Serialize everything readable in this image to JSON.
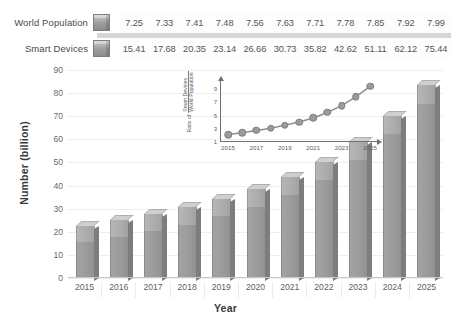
{
  "legend": {
    "rows": [
      {
        "name": "World Population",
        "swatch": "bar-swatch-icon",
        "values": [
          "7.25",
          "7.33",
          "7.41",
          "7.48",
          "7.56",
          "7.63",
          "7.71",
          "7.78",
          "7.85",
          "7.92",
          "7.99"
        ]
      },
      {
        "name": "Smart Devices",
        "swatch": "bar-swatch-icon",
        "values": [
          "15.41",
          "17.68",
          "20.35",
          "23.14",
          "26.66",
          "30.73",
          "35.82",
          "42.62",
          "51.11",
          "62.12",
          "75.44"
        ]
      }
    ]
  },
  "chart_data": [
    {
      "type": "bar",
      "title": "",
      "xlabel": "Year",
      "ylabel": "Number (billion)",
      "categories": [
        "2015",
        "2016",
        "2017",
        "2018",
        "2019",
        "2020",
        "2021",
        "2022",
        "2023",
        "2024",
        "2025"
      ],
      "stacked": true,
      "series": [
        {
          "name": "Smart Devices",
          "values": [
            15.41,
            17.68,
            20.35,
            23.14,
            26.66,
            30.73,
            35.82,
            42.62,
            51.11,
            62.12,
            75.44
          ]
        },
        {
          "name": "World Population",
          "values": [
            7.25,
            7.33,
            7.41,
            7.48,
            7.56,
            7.63,
            7.71,
            7.78,
            7.85,
            7.92,
            7.99
          ]
        }
      ],
      "totals": [
        22.66,
        25.01,
        27.76,
        30.62,
        34.22,
        38.36,
        43.53,
        50.4,
        58.96,
        70.04,
        83.43
      ],
      "ylim": [
        0,
        90
      ],
      "yticks": [
        "90",
        "80",
        "70",
        "60",
        "50",
        "40",
        "30",
        "20",
        "10",
        "0"
      ],
      "grid": true,
      "legend_position": "top-table"
    },
    {
      "type": "line",
      "title": "",
      "ylabel_prefix": "Ratio of",
      "ylabel_numerator": "Smart Devices",
      "ylabel_denominator": "World Population",
      "x": [
        "2015",
        "2016",
        "2017",
        "2018",
        "2019",
        "2020",
        "2021",
        "2022",
        "2023",
        "2024",
        "2025"
      ],
      "xticks": [
        "2015",
        "2017",
        "2019",
        "2021",
        "2023",
        "2025"
      ],
      "values": [
        2.13,
        2.41,
        2.75,
        3.09,
        3.53,
        4.03,
        4.65,
        5.48,
        6.51,
        7.84,
        9.44
      ],
      "ylim": [
        1,
        9.8
      ],
      "yticks": [
        "9",
        "7",
        "5",
        "3",
        "1"
      ],
      "grid": false,
      "marker": "circle"
    }
  ],
  "colors": {
    "bar_lower": "#9a9a9a",
    "bar_upper": "#ababab",
    "bar_top_face": "#cfcfcf",
    "bar_side_face": "#7d7d7d",
    "gridline": "#eeeeee",
    "axis": "#6f6f6f",
    "text": "#3b3b3b"
  }
}
